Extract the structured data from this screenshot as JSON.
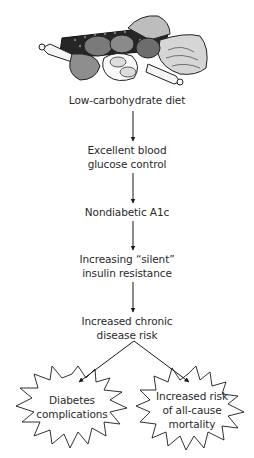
{
  "illustration": {
    "description": "low-carbohydrate foods: meats, eggs, chicken drumsticks, salmon steak",
    "icon": "food-illustration-icon"
  },
  "flow": {
    "nodes": [
      {
        "id": "diet",
        "lines": [
          "Low-carbohydrate diet"
        ]
      },
      {
        "id": "glucose",
        "lines": [
          "Excellent blood",
          "glucose control"
        ]
      },
      {
        "id": "a1c",
        "lines": [
          "Nondiabetic A1c"
        ]
      },
      {
        "id": "insulin",
        "lines": [
          "Increasing “silent”",
          "insulin resistance"
        ]
      },
      {
        "id": "chronic",
        "lines": [
          "Increased chronic",
          "disease risk"
        ]
      }
    ],
    "outcomes": [
      {
        "id": "complications",
        "lines": [
          "Diabetes",
          "complications"
        ]
      },
      {
        "id": "mortality",
        "lines": [
          "Increased risk",
          "of all-cause",
          "mortality"
        ]
      }
    ]
  },
  "colors": {
    "text": "#2a2a2a",
    "line": "#1a1a1a"
  }
}
